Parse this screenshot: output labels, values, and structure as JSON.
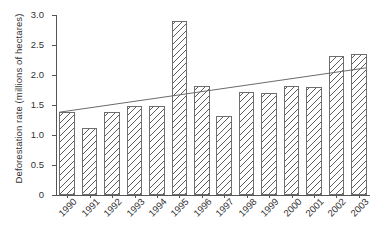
{
  "chart_data": {
    "type": "bar",
    "title": "",
    "xlabel": "",
    "ylabel": "Deforestation rate (millions of hectares)",
    "categories": [
      "1990",
      "1991",
      "1992",
      "1993",
      "1994",
      "1995",
      "1996",
      "1997",
      "1998",
      "1999",
      "2000",
      "2001",
      "2002",
      "2003"
    ],
    "values": [
      1.38,
      1.12,
      1.38,
      1.48,
      1.48,
      2.9,
      1.81,
      1.32,
      1.72,
      1.7,
      1.81,
      1.8,
      2.31,
      2.35
    ],
    "ylim": [
      0,
      3.0
    ],
    "ytick_labels": [
      "3.0",
      "2.5",
      "2.0",
      "1.5",
      "1.0",
      "0.5",
      "0"
    ],
    "ytick_values": [
      3.0,
      2.5,
      2.0,
      1.5,
      1.0,
      0.5,
      0
    ],
    "grid": false,
    "legend": "none",
    "bar_style": {
      "fill": "#ffffff",
      "hatch": "diagonal-lines",
      "edge_color": "#6e6e6e"
    },
    "trendline": {
      "type": "linear",
      "color": "#6b6b6b",
      "start": {
        "x_category": "1990",
        "y": 1.38
      },
      "end": {
        "x_category": "2003",
        "y": 2.12
      }
    }
  },
  "axis": {
    "y_title": "Deforestation rate (millions of hectares)"
  }
}
